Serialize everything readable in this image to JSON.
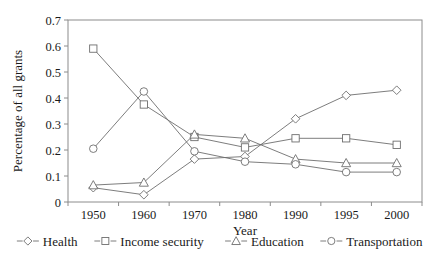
{
  "chart_data": {
    "type": "line",
    "title": "",
    "xlabel": "Year",
    "ylabel": "Percentage of all grants",
    "x": [
      1950,
      1960,
      1970,
      1980,
      1990,
      1995,
      2000
    ],
    "categories": [
      "1950",
      "1960",
      "1970",
      "1980",
      "1990",
      "1995",
      "2000"
    ],
    "xlim": [
      1945,
      2005
    ],
    "ylim": [
      0,
      0.7
    ],
    "yticks": [
      0,
      0.1,
      0.2,
      0.3,
      0.4,
      0.5,
      0.6,
      0.7
    ],
    "ytick_labels": [
      "0",
      "0.1",
      "0.2",
      "0.3",
      "0.4",
      "0.5",
      "0.6",
      "0.7"
    ],
    "grid": false,
    "legend_position": "bottom",
    "series": [
      {
        "name": "Health",
        "marker": "diamond",
        "values": [
          0.055,
          0.028,
          0.165,
          0.175,
          0.32,
          0.41,
          0.43
        ]
      },
      {
        "name": "Income security",
        "marker": "square",
        "values": [
          0.59,
          0.375,
          0.25,
          0.21,
          0.245,
          0.245,
          0.22
        ]
      },
      {
        "name": "Education",
        "marker": "triangle",
        "values": [
          0.065,
          0.075,
          0.26,
          0.245,
          0.165,
          0.15,
          0.15
        ]
      },
      {
        "name": "Transportation",
        "marker": "circle",
        "values": [
          0.205,
          0.425,
          0.195,
          0.155,
          0.145,
          0.115,
          0.115
        ]
      }
    ]
  },
  "axes": {
    "y_title": "Percentage of all grants",
    "x_title": "Year"
  },
  "legend": {
    "items": [
      {
        "label": "Health",
        "marker": "diamond"
      },
      {
        "label": "Income security",
        "marker": "square"
      },
      {
        "label": "Education",
        "marker": "triangle"
      },
      {
        "label": "Transportation",
        "marker": "circle"
      }
    ]
  },
  "colors": {
    "line": "#6e6e6e",
    "axis": "#8c8c8c",
    "text": "#1a1a1a",
    "background": "#ffffff"
  }
}
